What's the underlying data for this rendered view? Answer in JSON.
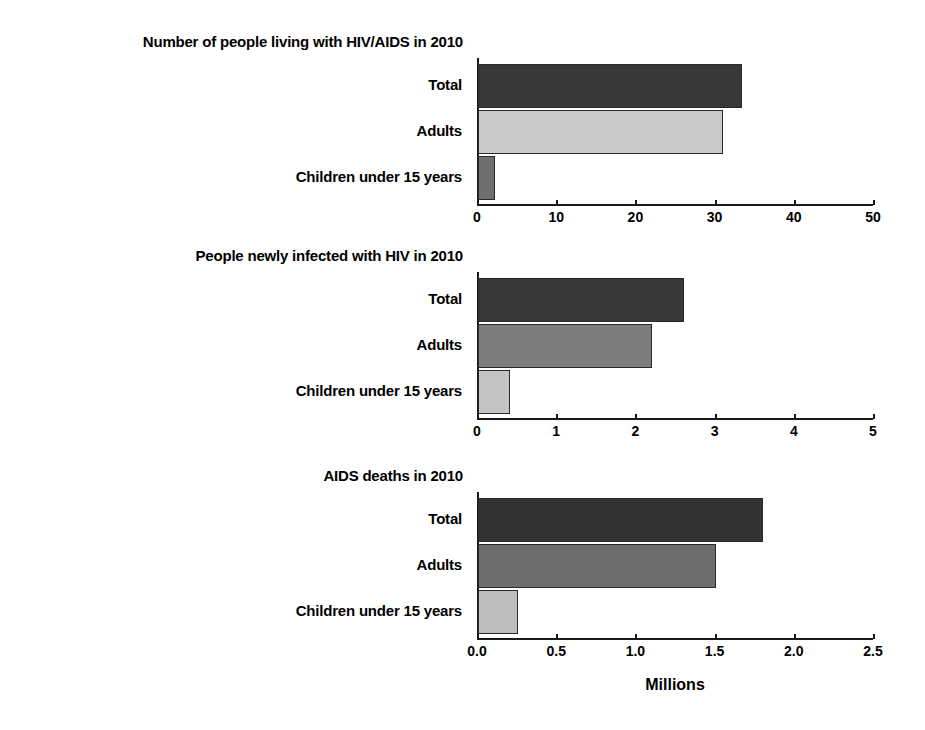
{
  "figure": {
    "axis_title": "Millions",
    "categories": [
      "Total",
      "Adults",
      "Children under 15 years"
    ]
  },
  "chart_data": [
    {
      "type": "bar",
      "orientation": "horizontal",
      "title": "Number of people living with HIV/AIDS in 2010",
      "categories": [
        "Total",
        "Adults",
        "Children under 15 years"
      ],
      "values": [
        33.3,
        30.9,
        2.2
      ],
      "xlabel": "Millions",
      "ylabel": "",
      "xlim": [
        0,
        50
      ],
      "xticks": [
        0,
        10,
        20,
        30,
        40,
        50
      ],
      "xticklabels": [
        "0",
        "10",
        "20",
        "30",
        "40",
        "50"
      ],
      "bar_colors": [
        "#383838",
        "#c9c9c9",
        "#6f6f6f"
      ],
      "grid": false,
      "legend": "none"
    },
    {
      "type": "bar",
      "orientation": "horizontal",
      "title": "People newly infected with HIV in 2010",
      "categories": [
        "Total",
        "Adults",
        "Children under 15 years"
      ],
      "values": [
        2.6,
        2.2,
        0.4
      ],
      "xlabel": "Millions",
      "ylabel": "",
      "xlim": [
        0,
        5
      ],
      "xticks": [
        0,
        1,
        2,
        3,
        4,
        5
      ],
      "xticklabels": [
        "0",
        "1",
        "2",
        "3",
        "4",
        "5"
      ],
      "bar_colors": [
        "#383838",
        "#7d7d7d",
        "#c4c4c4"
      ],
      "grid": false,
      "legend": "none"
    },
    {
      "type": "bar",
      "orientation": "horizontal",
      "title": "AIDS deaths in 2010",
      "categories": [
        "Total",
        "Adults",
        "Children under 15 years"
      ],
      "values": [
        1.8,
        1.5,
        0.25
      ],
      "xlabel": "Millions",
      "ylabel": "",
      "xlim": [
        0,
        2.5
      ],
      "xticks": [
        0,
        0.5,
        1.0,
        1.5,
        2.0,
        2.5
      ],
      "xticklabels": [
        "0.0",
        "0.5",
        "1.0",
        "1.5",
        "2.0",
        "2.5"
      ],
      "bar_colors": [
        "#333333",
        "#6d6d6d",
        "#bdbdbd"
      ],
      "grid": false,
      "legend": "none"
    }
  ]
}
